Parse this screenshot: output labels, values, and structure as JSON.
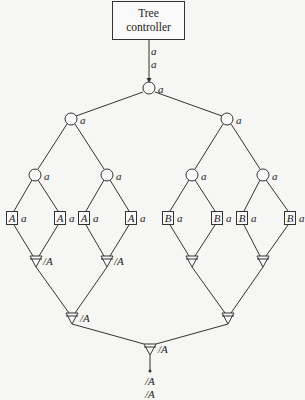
{
  "controller": {
    "line1": "Tree",
    "line2": "controller"
  },
  "top_signals": [
    "a",
    "a"
  ],
  "internal_label": "a",
  "leaf_label": "a",
  "leaves": [
    "A",
    "A",
    "A",
    "A",
    "B",
    "B",
    "B",
    "B"
  ],
  "combiner_label": "/A",
  "output_signals": [
    "/A",
    "/A"
  ]
}
